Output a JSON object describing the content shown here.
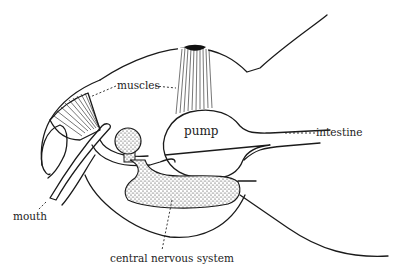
{
  "diagram": {
    "labels": {
      "muscles": "muscles",
      "pump": "pump",
      "intestine": "intestine",
      "mouth": "mouth",
      "cns": "central nervous system"
    },
    "colors": {
      "ink": "#1a1a1a",
      "background": "#ffffff"
    }
  }
}
